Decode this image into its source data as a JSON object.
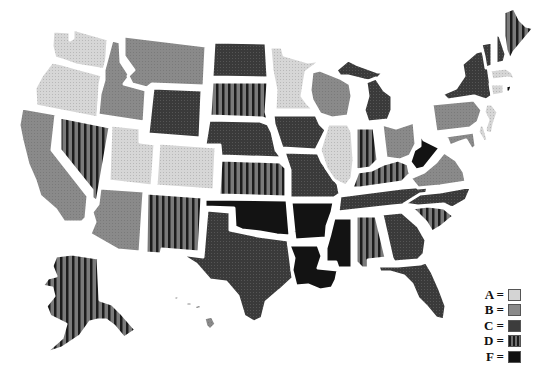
{
  "legend": {
    "items": [
      {
        "grade": "A",
        "label": "A ="
      },
      {
        "grade": "B",
        "label": "B ="
      },
      {
        "grade": "C",
        "label": "C ="
      },
      {
        "grade": "D",
        "label": "D ="
      },
      {
        "grade": "F",
        "label": "F ="
      }
    ]
  },
  "grade_styles": {
    "A": {
      "fill": "#d4d4d4",
      "pattern": "dots"
    },
    "B": {
      "fill": "#8a8a8a",
      "pattern": "solid"
    },
    "C": {
      "fill": "#3c3c3c",
      "pattern": "dots"
    },
    "D": {
      "fill": "#6e6e6e",
      "pattern": "stripes",
      "stripe": "#1a1a1a"
    },
    "F": {
      "fill": "#111111",
      "pattern": "solid"
    }
  },
  "states": {
    "WA": "A",
    "OR": "A",
    "CA": "B",
    "NV": "D",
    "ID": "B",
    "MT": "B",
    "WY": "C",
    "UT": "A",
    "CO": "A",
    "AZ": "B",
    "NM": "D",
    "ND": "C",
    "SD": "D",
    "NE": "C",
    "KS": "D",
    "OK": "F",
    "TX": "C",
    "MN": "A",
    "IA": "C",
    "MO": "C",
    "AR": "F",
    "LA": "F",
    "WI": "B",
    "IL": "A",
    "MI": "C",
    "IN": "D",
    "OH": "B",
    "KY": "D",
    "TN": "C",
    "MS": "F",
    "AL": "D",
    "GA": "C",
    "FL": "C",
    "SC": "D",
    "NC": "C",
    "VA": "B",
    "WV": "F",
    "PA": "B",
    "NY": "C",
    "VT": "C",
    "NH": "C",
    "ME": "D",
    "MA": "A",
    "CT": "A",
    "RI": "F",
    "NJ": "A",
    "DE": "A",
    "MD": "B",
    "AK": "D",
    "HI": "B"
  }
}
